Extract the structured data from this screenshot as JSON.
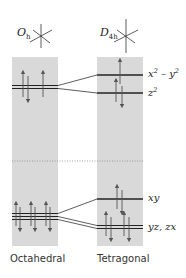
{
  "diagram": {
    "columns": [
      {
        "id": "octahedral",
        "symmetry": {
          "letter": "O",
          "sub": "h"
        },
        "caption": "Octahedral",
        "levels": [
          {
            "name": "eg",
            "y": 87,
            "lines": 2,
            "electrons": [
              "updown",
              "up"
            ]
          },
          {
            "name": "t2g",
            "y": 216,
            "lines": 3,
            "electrons": [
              "updown",
              "updown",
              "updown"
            ]
          }
        ]
      },
      {
        "id": "tetragonal",
        "symmetry": {
          "letter": "D",
          "sub": "4h"
        },
        "caption": "Tetragonal",
        "levels": [
          {
            "name": "x2-y2",
            "label_main": "x",
            "label_sup1": "2",
            "label_mid": " – y",
            "label_sup2": "2",
            "y": 75,
            "electrons": [
              "up"
            ]
          },
          {
            "name": "z2",
            "label_main": "z",
            "label_sup1": "2",
            "y": 93,
            "electrons": [
              "updown"
            ]
          },
          {
            "name": "xy",
            "label": "xy",
            "y": 199,
            "electrons": [
              "updown"
            ]
          },
          {
            "name": "yz,zx",
            "label": "yz, zx",
            "y": 227,
            "electrons": [
              "updown",
              "updown"
            ]
          }
        ]
      }
    ],
    "electron_count": 9,
    "divider": "dotted",
    "colors": {
      "column_fill": "#d9d9d9",
      "line": "#222222",
      "arrow": "#555555",
      "divider": "#888888"
    }
  }
}
